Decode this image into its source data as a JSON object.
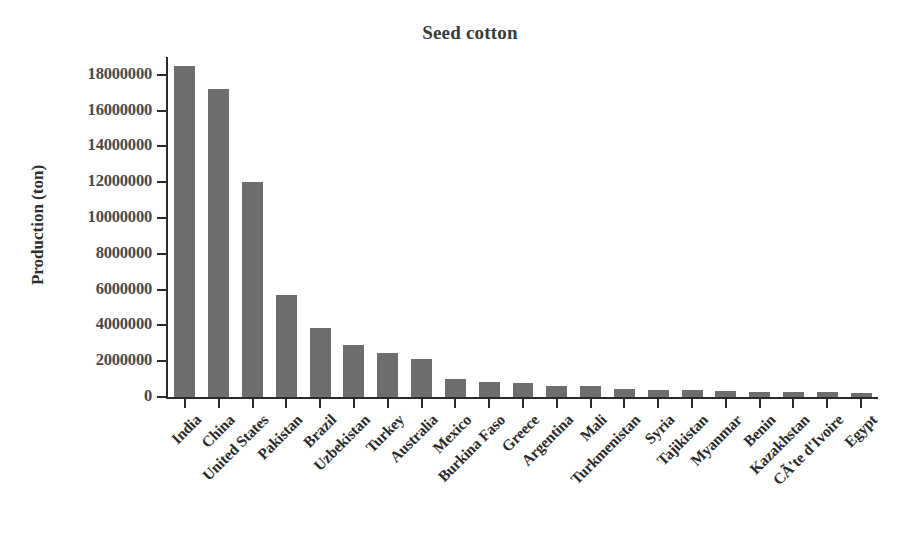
{
  "chart_data": {
    "type": "bar",
    "title": "Seed cotton",
    "xlabel": "",
    "ylabel": "Production (ton)",
    "ylim": [
      0,
      19000000
    ],
    "grid": false,
    "legend": null,
    "bar_color": "#6e6e6e",
    "axis_color": "#2b2b2b",
    "tick_label_color": "#4a4a4a",
    "y_ticks": [
      0,
      2000000,
      4000000,
      6000000,
      8000000,
      10000000,
      12000000,
      14000000,
      16000000,
      18000000
    ],
    "y_tick_labels": [
      "0",
      "2000000",
      "4000000",
      "6000000",
      "8000000",
      "10000000",
      "12000000",
      "14000000",
      "16000000",
      "18000000"
    ],
    "categories": [
      "India",
      "China",
      "United States",
      "Pakistan",
      "Brazil",
      "Uzbekistan",
      "Turkey",
      "Australia",
      "Mexico",
      "Burkina Faso",
      "Greece",
      "Argentina",
      "Mali",
      "Turkmenistan",
      "Syria",
      "Tajikistan",
      "Myanmar",
      "Benin",
      "Kazakhstan",
      "CÃ'te d'Ivoire",
      "Egypt"
    ],
    "values": [
      18500000,
      17200000,
      12000000,
      5700000,
      3850000,
      2900000,
      2450000,
      2150000,
      980000,
      850000,
      780000,
      620000,
      600000,
      450000,
      400000,
      380000,
      360000,
      300000,
      290000,
      280000,
      230000
    ]
  }
}
